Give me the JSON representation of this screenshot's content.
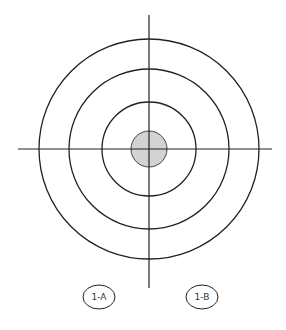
{
  "diagram": {
    "type": "concentric-target",
    "center": {
      "x": 149,
      "y": 149
    },
    "rings": [
      {
        "name": "outer-ring",
        "r": 110
      },
      {
        "name": "middle-ring",
        "r": 80
      },
      {
        "name": "inner-ring",
        "r": 47
      }
    ],
    "bullseye": {
      "r": 18,
      "fill": "#d3d3d3"
    },
    "crosshair": {
      "horizontal": {
        "x1": 18,
        "x2": 272,
        "y": 149
      },
      "vertical": {
        "y1": 15,
        "y2": 288,
        "x": 149
      }
    },
    "stroke_color": "#222222",
    "labels": [
      {
        "text": "1-A",
        "cx": 99,
        "cy": 297
      },
      {
        "text": "1-B",
        "cx": 202,
        "cy": 297
      }
    ]
  }
}
